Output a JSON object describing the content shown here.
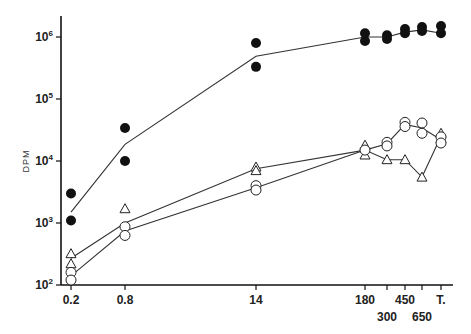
{
  "chart_data": {
    "type": "scatter",
    "title": "",
    "xlabel": "",
    "ylabel": "DPM",
    "yscale": "log",
    "ylim": [
      100,
      2000000
    ],
    "grid": false,
    "legend": null,
    "x_categories": [
      "0.2",
      "0.8",
      "14",
      "180",
      "300",
      "450",
      "650",
      "T."
    ],
    "y_tick_labels": [
      {
        "base": "10",
        "exp": "2"
      },
      {
        "base": "10",
        "exp": "3"
      },
      {
        "base": "10",
        "exp": "4"
      },
      {
        "base": "10",
        "exp": "5"
      },
      {
        "base": "10",
        "exp": "6"
      }
    ],
    "series": [
      {
        "name": "filled circles",
        "marker": "filled-circle",
        "points": [
          {
            "x": "0.2",
            "values": [
              3000,
              1100
            ]
          },
          {
            "x": "0.8",
            "values": [
              34000,
              10000
            ]
          },
          {
            "x": "14",
            "values": [
              800000,
              330000
            ]
          },
          {
            "x": "180",
            "values": [
              1150000,
              860000
            ]
          },
          {
            "x": "300",
            "values": [
              1070000,
              930000
            ]
          },
          {
            "x": "450",
            "values": [
              1350000,
              1150000
            ]
          },
          {
            "x": "650",
            "values": [
              1450000,
              1250000
            ]
          },
          {
            "x": "T.",
            "values": [
              1500000,
              1150000
            ]
          }
        ],
        "line": [
          1500,
          18600,
          490000,
          1000000,
          1000000,
          1200000,
          1300000,
          1150000
        ]
      },
      {
        "name": "open triangles",
        "marker": "open-triangle",
        "points": [
          {
            "x": "0.2",
            "values": [
              320,
              220
            ]
          },
          {
            "x": "0.8",
            "values": [
              1700
            ]
          },
          {
            "x": "14",
            "values": [
              8000,
              7000
            ]
          },
          {
            "x": "180",
            "values": [
              18000,
              12500
            ]
          },
          {
            "x": "300",
            "values": [
              10500
            ]
          },
          {
            "x": "450",
            "values": [
              10500
            ]
          },
          {
            "x": "650",
            "values": [
              5500
            ]
          },
          {
            "x": "T.",
            "values": [
              28000,
              23000
            ]
          }
        ],
        "line": [
          270,
          1000,
          7500,
          15000,
          10500,
          10500,
          5500,
          25000
        ]
      },
      {
        "name": "open circles",
        "marker": "open-circle",
        "points": [
          {
            "x": "0.2",
            "values": [
              160,
              120
            ]
          },
          {
            "x": "0.8",
            "values": [
              870,
              630
            ]
          },
          {
            "x": "14",
            "values": [
              4000,
              3400
            ]
          },
          {
            "x": "180",
            "values": [
              15000
            ]
          },
          {
            "x": "300",
            "values": [
              20000,
              17500
            ]
          },
          {
            "x": "450",
            "values": [
              42000,
              36000
            ]
          },
          {
            "x": "650",
            "values": [
              41000,
              28000
            ]
          },
          {
            "x": "T.",
            "values": [
              24500,
              19500
            ]
          }
        ],
        "line": [
          140,
          740,
          3700,
          15000,
          19000,
          39000,
          34000,
          22000
        ]
      }
    ]
  }
}
